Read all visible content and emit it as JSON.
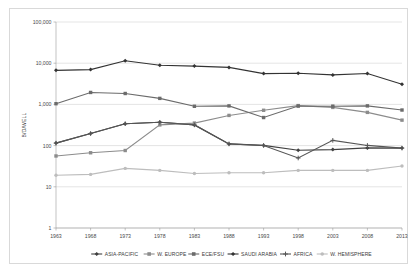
{
  "chart_data": {
    "type": "line",
    "title": "",
    "xlabel": "",
    "ylabel": "B/D/WELL",
    "yscale": "log",
    "ylim": [
      1,
      100000
    ],
    "ytick_labels": [
      "100,000",
      "10,000",
      "1,000",
      "100",
      "10",
      "1"
    ],
    "ytick_values": [
      100000,
      10000,
      1000,
      100,
      10,
      1
    ],
    "grid": "horizontal",
    "legend_position": "bottom",
    "categories": [
      1963,
      1968,
      1973,
      1978,
      1983,
      1988,
      1993,
      1998,
      2003,
      2008,
      2013
    ],
    "xtick_labels": [
      "1963",
      "1968",
      "1973",
      "1978",
      "1983",
      "1988",
      "1993",
      "1998",
      "2003",
      "2008",
      "2013"
    ],
    "series": [
      {
        "name": "ASIA-PACIFIC",
        "color": "#404040",
        "marker": "diamond",
        "values": [
          115,
          196,
          340,
          368,
          318,
          110,
          101,
          77,
          80,
          88,
          87
        ]
      },
      {
        "name": "W. EUROPE",
        "color": "#8c8c8c",
        "marker": "square",
        "values": [
          56,
          67,
          76,
          318,
          352,
          540,
          720,
          935,
          845,
          640,
          415
        ]
      },
      {
        "name": "ECE/FSU",
        "color": "#6b6b6b",
        "marker": "square",
        "values": [
          1040,
          1950,
          1840,
          1400,
          900,
          920,
          480,
          910,
          905,
          920,
          730
        ]
      },
      {
        "name": "SAUDI ARABIA",
        "color": "#333333",
        "marker": "diamond",
        "values": [
          6700,
          7000,
          11500,
          8900,
          8500,
          7900,
          5600,
          5700,
          5200,
          5600,
          3100
        ]
      },
      {
        "name": "AFRICA",
        "color": "#555555",
        "marker": "plus",
        "values": [
          115,
          196,
          340,
          368,
          318,
          110,
          101,
          50,
          134,
          101,
          87
        ]
      },
      {
        "name": "W. HEMISPHERE",
        "color": "#bdbdbd",
        "marker": "circle",
        "values": [
          19,
          20,
          28,
          25,
          21,
          22,
          22,
          25,
          25,
          25,
          32
        ]
      }
    ]
  },
  "legend": {
    "items": [
      {
        "label": "ASIA-PACIFIC",
        "color": "#404040",
        "marker": "diamond"
      },
      {
        "label": "W. EUROPE",
        "color": "#8c8c8c",
        "marker": "square"
      },
      {
        "label": "ECE/FSU",
        "color": "#6b6b6b",
        "marker": "square"
      },
      {
        "label": "SAUDI ARABIA",
        "color": "#333333",
        "marker": "diamond"
      },
      {
        "label": "AFRICA",
        "color": "#555555",
        "marker": "plus"
      },
      {
        "label": "W. HEMISPHERE",
        "color": "#bdbdbd",
        "marker": "circle"
      }
    ]
  }
}
